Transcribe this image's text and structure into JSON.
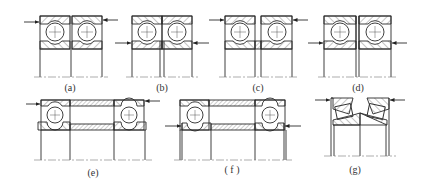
{
  "figure": {
    "colors": {
      "line": "#2a2a2a",
      "hatch": "#555555",
      "centerline": "#666666",
      "background": "#ffffff"
    },
    "panels": [
      {
        "id": "a",
        "label": "(a)",
        "type": "back-to-back pair",
        "label_x": 70,
        "label_y": 82
      },
      {
        "id": "b",
        "label": "(b)",
        "type": "pair with inner ring gap",
        "label_x": 162,
        "label_y": 82
      },
      {
        "id": "c",
        "label": "(c)",
        "type": "pair with inner spacer",
        "label_x": 258,
        "label_y": 82
      },
      {
        "id": "d",
        "label": "(d)",
        "type": "face-to-face pair",
        "label_x": 358,
        "label_y": 82
      },
      {
        "id": "e",
        "label": "(e)",
        "type": "separated pair with spacers, load on outer rings",
        "label_x": 93,
        "label_y": 167
      },
      {
        "id": "f",
        "label": "( f )",
        "type": "separated pair with spacers, load on inner rings",
        "label_x": 232,
        "label_y": 164
      },
      {
        "id": "g",
        "label": "(g)",
        "type": "tapered roller pair",
        "label_x": 355,
        "label_y": 164
      }
    ]
  }
}
